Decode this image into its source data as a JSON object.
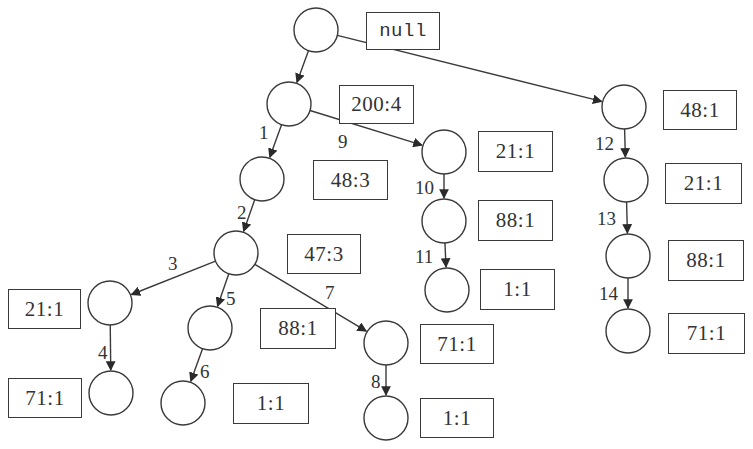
{
  "diagram": {
    "type": "prefix-tree",
    "nodes": [
      {
        "id": "root",
        "cx": 316,
        "cy": 30,
        "label": "null",
        "box": [
          366,
          12,
          74,
          38
        ]
      },
      {
        "id": "n200",
        "cx": 289,
        "cy": 104,
        "label": "200:4",
        "box": [
          339,
          85,
          75,
          39
        ]
      },
      {
        "id": "n48a",
        "cx": 262,
        "cy": 179,
        "label": "48:3",
        "box": [
          313,
          160,
          75,
          40
        ]
      },
      {
        "id": "n47",
        "cx": 236,
        "cy": 253,
        "label": "47:3",
        "box": [
          287,
          234,
          74,
          40
        ]
      },
      {
        "id": "n21a",
        "cx": 110,
        "cy": 303,
        "label": "21:1",
        "box": [
          8,
          289,
          73,
          40
        ]
      },
      {
        "id": "n71a",
        "cx": 111,
        "cy": 393,
        "label": "71:1",
        "box": [
          8,
          378,
          74,
          40
        ]
      },
      {
        "id": "n88a",
        "cx": 210,
        "cy": 328,
        "label": "88:1",
        "box": [
          260,
          308,
          76,
          41
        ]
      },
      {
        "id": "n1a",
        "cx": 183,
        "cy": 403,
        "label": "1:1",
        "box": [
          233,
          383,
          76,
          41
        ]
      },
      {
        "id": "n71b",
        "cx": 386,
        "cy": 343,
        "label": "71:1",
        "box": [
          420,
          324,
          74,
          40
        ]
      },
      {
        "id": "n1b",
        "cx": 386,
        "cy": 418,
        "label": "1:1",
        "box": [
          420,
          398,
          74,
          40
        ]
      },
      {
        "id": "n21b",
        "cx": 444,
        "cy": 152,
        "label": "21:1",
        "box": [
          478,
          131,
          75,
          41
        ]
      },
      {
        "id": "n88b",
        "cx": 444,
        "cy": 221,
        "label": "88:1",
        "box": [
          478,
          200,
          75,
          41
        ]
      },
      {
        "id": "n1c",
        "cx": 447,
        "cy": 290,
        "label": "1:1",
        "box": [
          480,
          269,
          75,
          41
        ]
      },
      {
        "id": "n48b",
        "cx": 624,
        "cy": 107,
        "label": "48:1",
        "box": [
          663,
          90,
          74,
          40
        ]
      },
      {
        "id": "n21c",
        "cx": 626,
        "cy": 180,
        "label": "21:1",
        "box": [
          665,
          163,
          77,
          41
        ]
      },
      {
        "id": "n88c",
        "cx": 628,
        "cy": 256,
        "label": "88:1",
        "box": [
          668,
          240,
          76,
          41
        ]
      },
      {
        "id": "n71c",
        "cx": 628,
        "cy": 331,
        "label": "71:1",
        "box": [
          668,
          313,
          77,
          41
        ]
      }
    ],
    "edges": [
      {
        "from": "root",
        "to": "n200",
        "label": ""
      },
      {
        "from": "root",
        "to": "n48b",
        "label": ""
      },
      {
        "from": "n200",
        "to": "n48a",
        "label": "1",
        "lx": 259,
        "ly": 123
      },
      {
        "from": "n48a",
        "to": "n47",
        "label": "2",
        "lx": 237,
        "ly": 203
      },
      {
        "from": "n47",
        "to": "n21a",
        "label": "3",
        "lx": 168,
        "ly": 254
      },
      {
        "from": "n21a",
        "to": "n71a",
        "label": "4",
        "lx": 98,
        "ly": 343
      },
      {
        "from": "n47",
        "to": "n88a",
        "label": "5",
        "lx": 226,
        "ly": 289
      },
      {
        "from": "n88a",
        "to": "n1a",
        "label": "6",
        "lx": 200,
        "ly": 362
      },
      {
        "from": "n47",
        "to": "n71b",
        "label": "7",
        "lx": 325,
        "ly": 283
      },
      {
        "from": "n71b",
        "to": "n1b",
        "label": "8",
        "lx": 371,
        "ly": 372
      },
      {
        "from": "n200",
        "to": "n21b",
        "label": "9",
        "lx": 338,
        "ly": 132
      },
      {
        "from": "n21b",
        "to": "n88b",
        "label": "10",
        "lx": 415,
        "ly": 178
      },
      {
        "from": "n88b",
        "to": "n1c",
        "label": "11",
        "lx": 415,
        "ly": 247
      },
      {
        "from": "n48b",
        "to": "n21c",
        "label": "12",
        "lx": 595,
        "ly": 134
      },
      {
        "from": "n21c",
        "to": "n88c",
        "label": "13",
        "lx": 597,
        "ly": 209
      },
      {
        "from": "n88c",
        "to": "n71c",
        "label": "14",
        "lx": 599,
        "ly": 284
      }
    ],
    "style": {
      "node_radius": 22,
      "stroke": "#3a3a3a",
      "background": "#ffffff"
    }
  }
}
